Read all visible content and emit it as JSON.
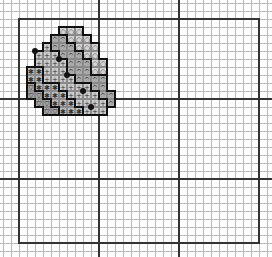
{
  "chart": {
    "cell_size": 8,
    "origin": [
      19,
      19
    ],
    "heavy_lines_x": [
      19,
      99,
      179,
      259
    ],
    "heavy_lines_y": [
      19,
      99,
      179,
      243
    ],
    "border": {
      "left": 19,
      "top": 19,
      "right": 259,
      "bottom": 243
    }
  },
  "symbols": {
    "O": {
      "glyph": "○",
      "color": "#d4d4d4",
      "name": "circle-symbol"
    },
    "A": {
      "glyph": "^",
      "color": "#a9a9a9",
      "name": "caret-symbol"
    },
    "P": {
      "glyph": "+",
      "color": "#cacaca",
      "name": "plus-symbol"
    },
    "S": {
      "glyph": "✱",
      "color": "#bcbcbc",
      "name": "asterisk-symbol"
    },
    "V": {
      "glyph": "▽",
      "color": "#a2a2a2",
      "name": "triangle-symbol"
    }
  },
  "rows": [
    {
      "r": 1,
      "start": 5,
      "cells": "OOO"
    },
    {
      "r": 2,
      "start": 4,
      "cells": "AAOOO"
    },
    {
      "r": 3,
      "start": 3,
      "cells": "PAAAOOO"
    },
    {
      "r": 4,
      "start": 2,
      "cells": "PPPAAAOO"
    },
    {
      "r": 5,
      "start": 2,
      "cells": "PPPPAAAOO"
    },
    {
      "r": 6,
      "start": 1,
      "cells": "SSPPPAAAOO"
    },
    {
      "r": 7,
      "start": 1,
      "cells": "SSPPPPAAAA"
    },
    {
      "r": 8,
      "start": 1,
      "cells": "VSSSPPPPAA"
    },
    {
      "r": 9,
      "start": 1,
      "cells": "VVSSSPPPPAA"
    },
    {
      "r": 10,
      "start": 2,
      "cells": "VVSSSPPPPA"
    },
    {
      "r": 11,
      "start": 3,
      "cells": "VVSSSPPP"
    }
  ],
  "dots": [
    [
      2,
      4
    ],
    [
      5,
      5
    ],
    [
      6,
      7
    ],
    [
      8,
      9
    ],
    [
      9,
      11
    ]
  ]
}
